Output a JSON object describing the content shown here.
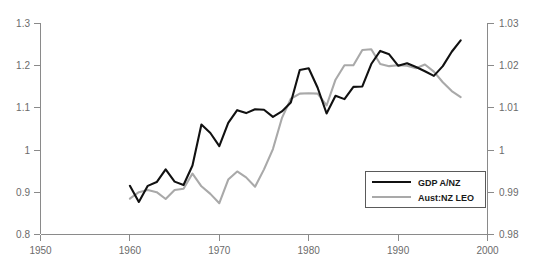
{
  "chart_data": {
    "type": "line",
    "title": "",
    "subtitle": "",
    "xlabel": "",
    "ylabel": "",
    "grid": false,
    "legend_position": "bottom-right-inside",
    "xlim": [
      1950,
      2000
    ],
    "x_ticks": [
      1950,
      1960,
      1970,
      1980,
      1990,
      2000
    ],
    "x_tick_labels": [
      "1950",
      "1960",
      "1970",
      "1980",
      "1990",
      "2000"
    ],
    "left_axis": {
      "ylim": [
        0.8,
        1.3
      ],
      "ticks": [
        0.8,
        0.9,
        1.0,
        1.1,
        1.2,
        1.3
      ],
      "tick_labels": [
        "0.8",
        "0.9",
        "1",
        "1.1",
        "1.2",
        "1.3"
      ]
    },
    "right_axis": {
      "ylim": [
        0.98,
        1.03
      ],
      "ticks": [
        0.98,
        0.99,
        1.0,
        1.01,
        1.02,
        1.03
      ],
      "tick_labels": [
        "0.98",
        "0.99",
        "1",
        "1.01",
        "1.02",
        "1.03"
      ]
    },
    "x": [
      1960,
      1961,
      1962,
      1963,
      1964,
      1965,
      1966,
      1967,
      1968,
      1969,
      1970,
      1971,
      1972,
      1973,
      1974,
      1975,
      1976,
      1977,
      1978,
      1979,
      1980,
      1981,
      1982,
      1983,
      1984,
      1985,
      1986,
      1987,
      1988,
      1989,
      1990,
      1991,
      1992,
      1993,
      1994,
      1995,
      1996,
      1997
    ],
    "series": [
      {
        "name": "GDP A/NZ",
        "color": "#111111",
        "axis": "left",
        "values": [
          0.915,
          0.877,
          0.915,
          0.924,
          0.954,
          0.925,
          0.917,
          0.963,
          1.06,
          1.04,
          1.009,
          1.064,
          1.094,
          1.087,
          1.096,
          1.095,
          1.078,
          1.091,
          1.112,
          1.189,
          1.193,
          1.147,
          1.086,
          1.128,
          1.12,
          1.149,
          1.15,
          1.203,
          1.234,
          1.226,
          1.199,
          1.205,
          1.196,
          1.186,
          1.175,
          1.198,
          1.232,
          1.259
        ]
      },
      {
        "name": "Aust:NZ LEO",
        "color": "#a9a9a9",
        "axis": "right",
        "values": [
          0.9885,
          0.99,
          0.9905,
          0.99,
          0.9884,
          0.9905,
          0.9908,
          0.9944,
          0.9914,
          0.9896,
          0.9874,
          0.993,
          0.9949,
          0.9935,
          0.9913,
          0.9954,
          1.0002,
          1.0075,
          1.0121,
          1.0133,
          1.0134,
          1.0133,
          1.0105,
          1.0166,
          1.02,
          1.02,
          1.0236,
          1.0238,
          1.0203,
          1.0198,
          1.02,
          1.0199,
          1.0193,
          1.0202,
          1.0185,
          1.016,
          1.0139,
          1.0125
        ]
      }
    ]
  },
  "legend": {
    "items": [
      {
        "label": "GDP A/NZ",
        "swatch": "black-line-swatch"
      },
      {
        "label": "Aust:NZ LEO",
        "swatch": "gray-line-swatch"
      }
    ]
  },
  "axis_labels": {
    "left": [
      "1.3",
      "1.2",
      "1.1",
      "1",
      "0.9",
      "0.8"
    ],
    "right": [
      "1.03",
      "1.02",
      "1.01",
      "1",
      "0.99",
      "0.98"
    ],
    "bottom": [
      "1950",
      "1960",
      "1970",
      "1980",
      "1990",
      "2000"
    ]
  }
}
